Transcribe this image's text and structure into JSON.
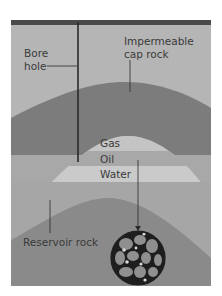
{
  "diagram": {
    "labels": {
      "bore_hole_line1": "Bore",
      "bore_hole_line2": "hole",
      "cap_rock_line1": "Impermeable",
      "cap_rock_line2": "cap rock",
      "gas": "Gas",
      "oil": "Oil",
      "water": "Water",
      "reservoir_rock": "Reservoir rock"
    },
    "colors": {
      "surface_bar": "#4a4a4a",
      "background": "#b5b5b5",
      "cap_rock": "#7c7c7c",
      "gas_dome": "#c4c4c4",
      "oil_band": "#a8a8a8",
      "water_band": "#cacaca",
      "lower_layer": "#a6a6a6",
      "reservoir_rock": "#8a8a8a",
      "lines": "#2a2a2a",
      "pore_grains": "#8f8f8f",
      "pore_gaps": "#1e1e1e",
      "pore_oil_droplets": "#d8d8d8"
    }
  }
}
